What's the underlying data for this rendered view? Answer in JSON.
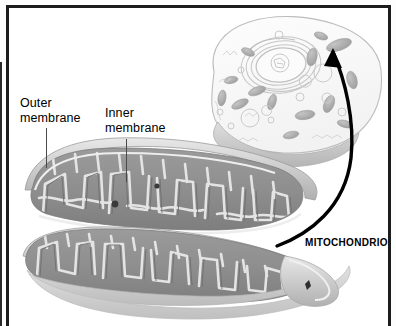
{
  "figure": {
    "background": "#fdfdfd",
    "frame_color": "#1c1c1c"
  },
  "labels": {
    "outer_membrane": "Outer\nmembrane",
    "inner_membrane": "Inner\nmembrane",
    "mitochondrion": "MITOCHONDRION"
  },
  "icons": {
    "leader_line_outer": "leader-line-icon",
    "leader_line_inner": "leader-line-icon",
    "callout_arrow": "curved-arrow-icon"
  },
  "colors": {
    "ink": "#000000",
    "leader": "#4a4a4a",
    "matrix_dark": "#8a8a8a",
    "matrix_mid": "#a6a6a6",
    "cristae_light": "#d8d8d8",
    "membrane_pale": "#c9c9c9",
    "cell_outline": "#b9b9b9",
    "organelle_grey": "#b0b0b0",
    "arrow": "#000000"
  },
  "structures": {
    "cell": {
      "name": "animal cell cutaway",
      "parts": [
        "plasma membrane",
        "nucleus",
        "nucleolus",
        "endoplasmic reticulum",
        "mitochondria",
        "vesicles"
      ]
    },
    "mitochondrion": {
      "name": "mitochondrion cutaway",
      "parts": [
        "outer membrane",
        "inner membrane",
        "cristae",
        "matrix",
        "granules"
      ]
    }
  }
}
